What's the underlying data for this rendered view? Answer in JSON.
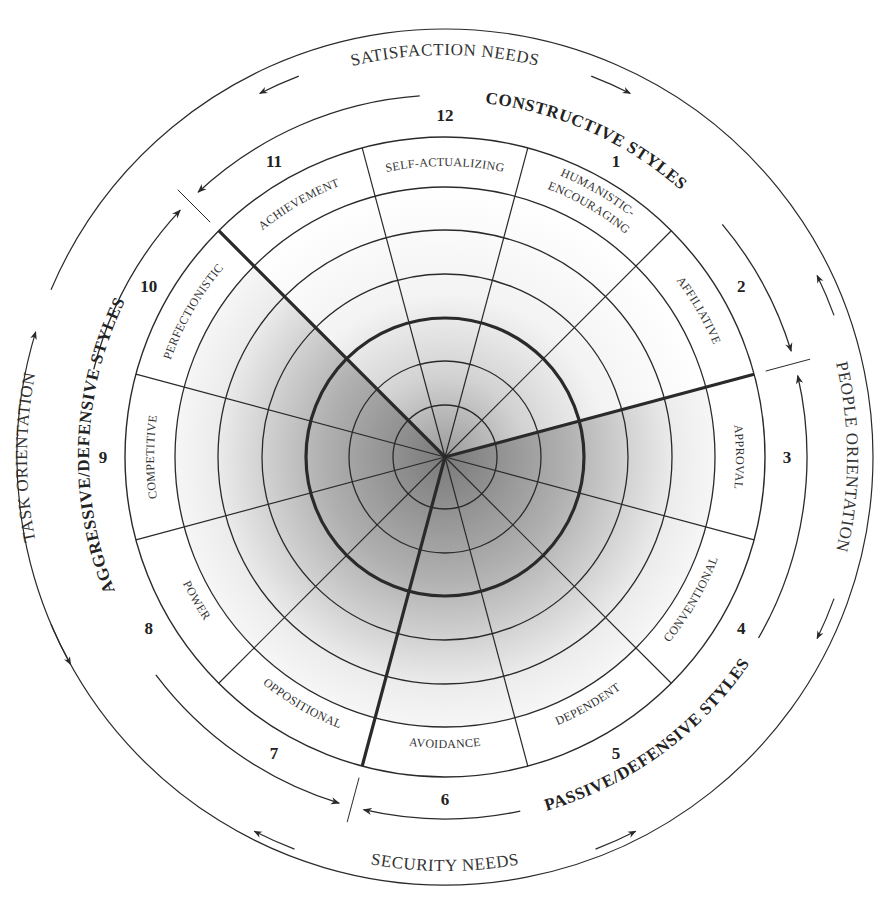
{
  "diagram": {
    "type": "circumplex",
    "center": [
      445,
      457
    ],
    "rings": {
      "inner_radii": [
        52,
        96,
        139,
        183,
        227
      ],
      "bold_ring_index": 2,
      "label_band_inner": 270,
      "label_band_outer": 320,
      "outer_arc": 362
    },
    "sector_boundary_start_deg": 15,
    "heavy_boundaries_deg": [
      15,
      135,
      255
    ],
    "sectors": [
      {
        "number": "1",
        "label": "HUMANISTIC-ENCOURAGING",
        "lines": [
          "HUMANISTIC-",
          "ENCOURAGING"
        ],
        "group": "constructive"
      },
      {
        "number": "2",
        "label": "AFFILIATIVE",
        "lines": [
          "AFFILIATIVE"
        ],
        "group": "constructive"
      },
      {
        "number": "3",
        "label": "APPROVAL",
        "lines": [
          "APPROVAL"
        ],
        "group": "passive"
      },
      {
        "number": "4",
        "label": "CONVENTIONAL",
        "lines": [
          "CONVENTIONAL"
        ],
        "group": "passive"
      },
      {
        "number": "5",
        "label": "DEPENDENT",
        "lines": [
          "DEPENDENT"
        ],
        "group": "passive"
      },
      {
        "number": "6",
        "label": "AVOIDANCE",
        "lines": [
          "AVOIDANCE"
        ],
        "group": "passive"
      },
      {
        "number": "7",
        "label": "OPPOSITIONAL",
        "lines": [
          "OPPOSITIONAL"
        ],
        "group": "aggressive"
      },
      {
        "number": "8",
        "label": "POWER",
        "lines": [
          "POWER"
        ],
        "group": "aggressive"
      },
      {
        "number": "9",
        "label": "COMPETITIVE",
        "lines": [
          "COMPETITIVE"
        ],
        "group": "aggressive"
      },
      {
        "number": "10",
        "label": "PERFECTIONISTIC",
        "lines": [
          "PERFECTIONISTIC"
        ],
        "group": "aggressive"
      },
      {
        "number": "11",
        "label": "ACHIEVEMENT",
        "lines": [
          "ACHIEVEMENT"
        ],
        "group": "constructive"
      },
      {
        "number": "12",
        "label": "SELF-ACTUALIZING",
        "lines": [
          "SELF-ACTUALIZING"
        ],
        "group": "constructive"
      }
    ],
    "style_groups": {
      "constructive": "CONSTRUCTIVE STYLES",
      "passive": "PASSIVE/DEFENSIVE STYLES",
      "aggressive": "AGGRESSIVE/DEFENSIVE STYLES"
    },
    "orientations": {
      "top": "SATISFACTION NEEDS",
      "bottom": "SECURITY NEEDS",
      "right": "PEOPLE ORIENTATION",
      "left": "TASK ORIENTATION"
    },
    "colors": {
      "line": "#2a2a2a",
      "shade_dark": "#8c8c8c",
      "shade_light": "#ffffff",
      "text": "#222222"
    }
  }
}
